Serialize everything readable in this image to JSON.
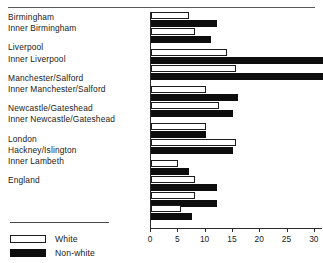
{
  "chart_data": {
    "type": "bar",
    "orientation": "horizontal",
    "title": "",
    "xlabel": "",
    "ylabel": "",
    "xlim": [
      0,
      31.5
    ],
    "xticks": [
      0,
      5,
      10,
      15,
      20,
      25,
      30
    ],
    "xtick_labels": [
      "0",
      "5",
      "10",
      "15",
      "20",
      "25",
      "30"
    ],
    "grid": false,
    "legend_position": "bottom-left",
    "categories": [
      "Birmingham",
      "Inner Birmingham",
      "Liverpool",
      "Inner Liverpool",
      "Manchester/Salford",
      "Inner Manchester/Salford",
      "Newcastle/Gateshead",
      "Inner Newcastle/Gateshead",
      "London",
      "Hackney/Islington",
      "Inner Lambeth",
      "England"
    ],
    "groups": [
      {
        "rows": [
          {
            "label": "Birmingham",
            "white": 7.0,
            "non_white": 12.0
          },
          {
            "label": "Inner Birmingham",
            "white": 8.0,
            "non_white": 11.0
          }
        ]
      },
      {
        "rows": [
          {
            "label": "Liverpool",
            "white": 14.0,
            "non_white": 31.5
          },
          {
            "label": "Inner Liverpool",
            "white": 15.5,
            "non_white": 31.5
          }
        ]
      },
      {
        "rows": [
          {
            "label": "Manchester/Salford",
            "white": 10.0,
            "non_white": 16.0
          },
          {
            "label": "Inner Manchester/Salford",
            "white": 12.5,
            "non_white": 15.0
          }
        ]
      },
      {
        "rows": [
          {
            "label": "Newcastle/Gateshead",
            "white": 10.0,
            "non_white": 10.0
          },
          {
            "label": "Inner Newcastle/Gateshead",
            "white": 15.5,
            "non_white": 15.0
          }
        ]
      },
      {
        "rows": [
          {
            "label": "London",
            "white": 5.0,
            "non_white": 7.0
          },
          {
            "label": "Hackney/Islington",
            "white": 8.0,
            "non_white": 12.0
          },
          {
            "label": "Inner Lambeth",
            "white": 8.0,
            "non_white": 12.0
          }
        ]
      },
      {
        "rows": [
          {
            "label": "England",
            "white": 5.5,
            "non_white": 7.5
          }
        ]
      }
    ],
    "series": [
      {
        "name": "White",
        "color": "#ffffff",
        "values": [
          7.0,
          8.0,
          14.0,
          15.5,
          10.0,
          12.5,
          10.0,
          15.5,
          5.0,
          8.0,
          8.0,
          5.5
        ]
      },
      {
        "name": "Non-white",
        "color": "#0d0d0d",
        "values": [
          12.0,
          11.0,
          31.5,
          31.5,
          16.0,
          15.0,
          10.0,
          15.0,
          7.0,
          12.0,
          12.0,
          7.5
        ]
      }
    ]
  },
  "legend": {
    "items": [
      {
        "label": "White",
        "swatch": "white"
      },
      {
        "label": "Non-white",
        "swatch": "nonwhite"
      }
    ]
  }
}
